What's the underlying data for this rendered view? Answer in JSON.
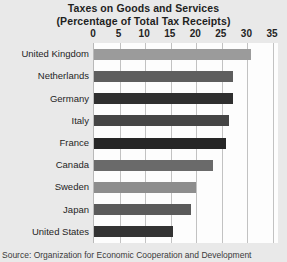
{
  "chart_data": {
    "type": "bar",
    "orientation": "horizontal",
    "title": "Taxes on Goods and Services",
    "subtitle": "(Percentage of Total Tax Receipts)",
    "xlabel": "",
    "ylabel": "",
    "xlim": [
      0,
      35
    ],
    "xticks": [
      0,
      5,
      10,
      15,
      20,
      25,
      30,
      35
    ],
    "xtick_labels": [
      "0",
      "5",
      "10",
      "15",
      "20",
      "25",
      "30",
      "35"
    ],
    "grid": true,
    "legend": false,
    "categories": [
      "United Kingdom",
      "Netherlands",
      "Germany",
      "Italy",
      "France",
      "Canada",
      "Sweden",
      "Japan",
      "United States"
    ],
    "values": [
      30.7,
      27.2,
      27.2,
      26.4,
      25.8,
      23.3,
      20.0,
      19.0,
      15.5
    ],
    "bar_colors": [
      "#9b9b9b",
      "#5e5e5e",
      "#2f2f2f",
      "#454545",
      "#262626",
      "#6a6a6a",
      "#8d8d8d",
      "#5a5a5a",
      "#333333"
    ],
    "source": "Source: Organization for Economic Cooperation and Development"
  },
  "figure": {
    "background_color": "#e9e9e9",
    "plot_background_color": "#fdfdfd",
    "gridline_color": "#c2c2c2"
  }
}
